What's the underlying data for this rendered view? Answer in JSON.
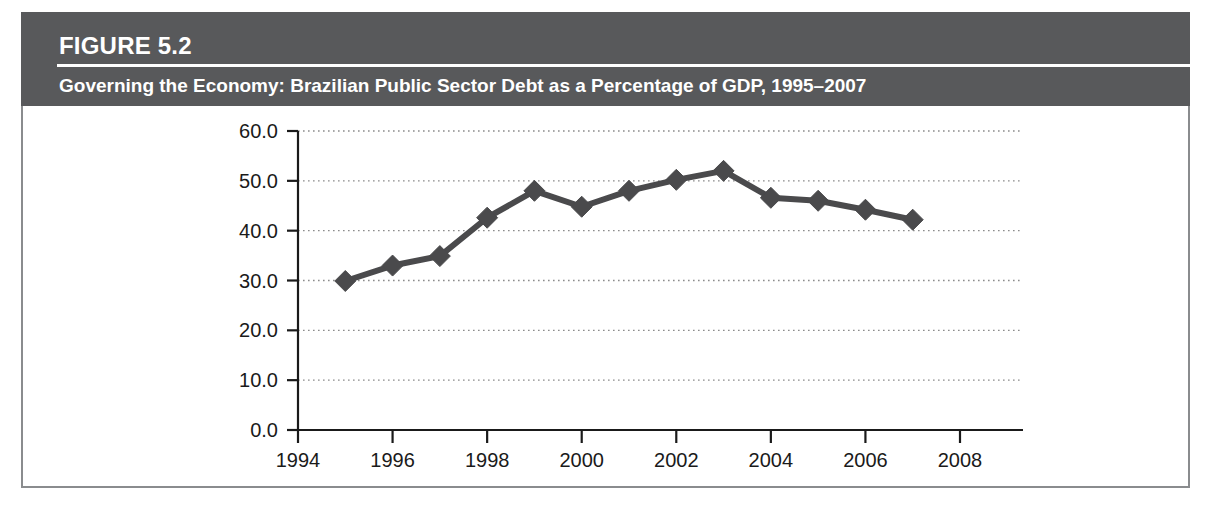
{
  "figure": {
    "number_label": "FIGURE 5.2",
    "title": "Governing the Economy: Brazilian Public Sector Debt as a Percentage of GDP, 1995–2007",
    "header_bg_color": "#58595b",
    "header_text_color": "#ffffff",
    "frame_border_color": "#8a8c8e"
  },
  "chart_data": {
    "type": "line",
    "title": "Governing the Economy: Brazilian Public Sector Debt as a Percentage of GDP, 1995–2007",
    "xlabel": "",
    "ylabel": "",
    "x": [
      1995,
      1996,
      1997,
      1998,
      1999,
      2000,
      2001,
      2002,
      2003,
      2004,
      2005,
      2006,
      2007
    ],
    "values": [
      29.9,
      33.0,
      34.9,
      42.6,
      48.0,
      44.8,
      48.0,
      50.2,
      52.0,
      46.6,
      46.0,
      44.2,
      42.2
    ],
    "series": [
      {
        "name": "Brazilian Public Sector Debt (% of GDP)",
        "values": [
          29.9,
          33.0,
          34.9,
          42.6,
          48.0,
          44.8,
          48.0,
          50.2,
          52.0,
          46.6,
          46.0,
          44.2,
          42.2
        ]
      }
    ],
    "xlim": [
      1994,
      2008
    ],
    "ylim": [
      0.0,
      60.0
    ],
    "x_ticks": [
      1994,
      1996,
      1998,
      2000,
      2002,
      2004,
      2006,
      2008
    ],
    "x_tick_labels": [
      "1994",
      "1996",
      "1998",
      "2000",
      "2002",
      "2004",
      "2006",
      "2008"
    ],
    "y_ticks": [
      0.0,
      10.0,
      20.0,
      30.0,
      40.0,
      50.0,
      60.0
    ],
    "y_tick_labels": [
      "0.0",
      "10.0",
      "20.0",
      "30.0",
      "40.0",
      "50.0",
      "60.0"
    ],
    "grid": "horizontal-dotted",
    "legend": "none",
    "line_color": "#4a4a4c",
    "marker": "diamond",
    "marker_color": "#4a4a4c",
    "grid_color": "#8c8c8c",
    "axis_color": "#1a1a1a"
  }
}
